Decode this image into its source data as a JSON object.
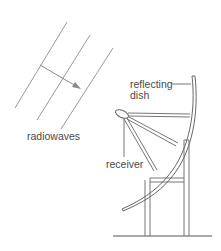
{
  "diagram": {
    "title": "",
    "labels": {
      "radiowaves": "radiowaves",
      "reflecting_dish_line1": "reflecting",
      "reflecting_dish_line2": "dish",
      "receiver": "receiver"
    },
    "elements": {
      "wavefronts": 3,
      "direction_arrow": "radio waves propagating toward dish",
      "reflecting_dish": "parabolic reflector",
      "receiver": "receiver at focus, held by struts",
      "stand": "two-legged support frame on ground line"
    },
    "colors": {
      "line": "#8a8a8a",
      "dark_line": "#555555",
      "text": "#4a4a4a",
      "background": "#ffffff"
    }
  }
}
